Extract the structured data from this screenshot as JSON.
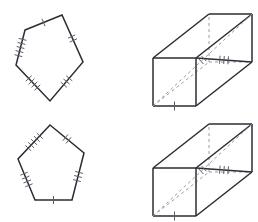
{
  "figure": {
    "background_color": "#ffffff",
    "stroke_color": "#2b2b33",
    "hidden_edge_color": "#9a9aa4",
    "tick_color": "#5c5c66",
    "canvas": {
      "width": 258,
      "height": 222
    },
    "shapes": [
      {
        "id": "pentagon-top-left",
        "name": "Pentagon A",
        "type": "pentagon",
        "position": "top-left",
        "vertices": [
          {
            "label": "A",
            "x": 25,
            "y": 30
          },
          {
            "label": "B",
            "x": 62,
            "y": 15
          },
          {
            "label": "C",
            "x": 83,
            "y": 62
          },
          {
            "label": "D",
            "x": 50,
            "y": 101
          },
          {
            "label": "E",
            "x": 16,
            "y": 65
          }
        ],
        "edges": [
          {
            "from": "A",
            "to": "B",
            "ticks": 1
          },
          {
            "from": "B",
            "to": "C",
            "ticks": 2
          },
          {
            "from": "C",
            "to": "D",
            "ticks": 3
          },
          {
            "from": "D",
            "to": "E",
            "ticks": 4
          },
          {
            "from": "E",
            "to": "A",
            "ticks": 5
          }
        ]
      },
      {
        "id": "pentagon-bottom-left",
        "name": "Pentagon B",
        "type": "pentagon",
        "position": "bottom-left",
        "vertices": [
          {
            "label": "A",
            "x": 50,
            "y": 125
          },
          {
            "label": "B",
            "x": 84,
            "y": 153
          },
          {
            "label": "C",
            "x": 72,
            "y": 200
          },
          {
            "label": "D",
            "x": 35,
            "y": 200
          },
          {
            "label": "E",
            "x": 18,
            "y": 159
          }
        ],
        "edges": [
          {
            "from": "A",
            "to": "B",
            "ticks": 2
          },
          {
            "from": "B",
            "to": "C",
            "ticks": 3
          },
          {
            "from": "C",
            "to": "D",
            "ticks": 1
          },
          {
            "from": "D",
            "to": "E",
            "ticks": 4
          },
          {
            "from": "E",
            "to": "A",
            "ticks": 5
          }
        ]
      },
      {
        "id": "prism-top-right",
        "name": "Rectangular Prism A",
        "type": "rectangular-prism",
        "position": "top-right",
        "front_face": {
          "x": 153,
          "y": 58,
          "width": 43,
          "height": 48
        },
        "depth_offset": {
          "dx": 56,
          "dy": -44
        },
        "visible_edges": 9,
        "hidden_edges": 3,
        "diagonals": [
          {
            "face": "right",
            "style": "solid",
            "ticks": 3
          },
          {
            "face": "front",
            "style": "dashed",
            "ticks": 2
          }
        ],
        "edge_ticks": [
          {
            "edge": "front-bottom",
            "ticks": 1
          }
        ]
      },
      {
        "id": "prism-bottom-right",
        "name": "Rectangular Prism B",
        "type": "rectangular-prism",
        "position": "bottom-right",
        "front_face": {
          "x": 153,
          "y": 168,
          "width": 43,
          "height": 48
        },
        "depth_offset": {
          "dx": 56,
          "dy": -44
        },
        "visible_edges": 9,
        "hidden_edges": 3,
        "diagonals": [
          {
            "face": "right",
            "style": "solid",
            "ticks": 3
          },
          {
            "face": "front",
            "style": "dashed",
            "ticks": 2
          }
        ],
        "edge_ticks": [
          {
            "edge": "front-bottom",
            "ticks": 1
          }
        ]
      }
    ]
  }
}
